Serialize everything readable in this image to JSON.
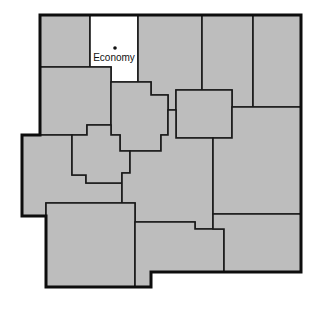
{
  "map": {
    "highlighted_county_city": "Economy",
    "colors": {
      "county_fill": "#bdbdbd",
      "highlight_fill": "#ffffff",
      "border": "#1a1a1a"
    },
    "city_marker": {
      "label": "Economy",
      "x": 115,
      "y": 48
    }
  }
}
